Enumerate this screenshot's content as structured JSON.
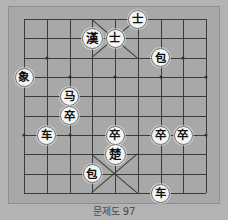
{
  "board": {
    "type": "janggi-xiangqi-diagram",
    "columns": 9,
    "rows": 10,
    "background_color": "#b3b3b3",
    "board_color": "#a8a8a8",
    "line_color": "#3b3b3b",
    "piece_face_color": "#f4f4f2",
    "piece_text_color": "#111111",
    "palace_top_columns": [
      3,
      5
    ],
    "palace_bottom_columns": [
      3,
      5
    ],
    "star_points": [
      {
        "col": 1,
        "row": 2
      },
      {
        "col": 7,
        "row": 2
      },
      {
        "col": 0,
        "row": 3
      },
      {
        "col": 2,
        "row": 3
      },
      {
        "col": 4,
        "row": 3
      },
      {
        "col": 6,
        "row": 3
      },
      {
        "col": 8,
        "row": 3
      },
      {
        "col": 1,
        "row": 6
      },
      {
        "col": 7,
        "row": 6
      },
      {
        "col": 0,
        "row": 6
      },
      {
        "col": 2,
        "row": 6
      },
      {
        "col": 4,
        "row": 6
      },
      {
        "col": 6,
        "row": 6
      },
      {
        "col": 8,
        "row": 6
      }
    ]
  },
  "pieces": [
    {
      "name": "advisor-top-right",
      "glyph": "士",
      "col": 5,
      "row": 0,
      "side": "top",
      "label": "advisor"
    },
    {
      "name": "general-han",
      "glyph": "漢",
      "col": 3,
      "row": 1,
      "side": "top",
      "label": "general-han",
      "big": true
    },
    {
      "name": "advisor-center",
      "glyph": "士",
      "col": 4,
      "row": 1,
      "side": "top",
      "label": "advisor"
    },
    {
      "name": "cannon-top-right",
      "glyph": "包",
      "col": 6,
      "row": 2,
      "side": "top",
      "label": "cannon"
    },
    {
      "name": "elephant-left",
      "glyph": "象",
      "col": 0,
      "row": 3,
      "side": "top",
      "label": "elephant"
    },
    {
      "name": "horse-left",
      "glyph": "马",
      "col": 2,
      "row": 4,
      "side": "bottom",
      "label": "horse"
    },
    {
      "name": "pawn-left-upper",
      "glyph": "卒",
      "col": 2,
      "row": 5,
      "side": "bottom",
      "label": "pawn"
    },
    {
      "name": "chariot-left",
      "glyph": "车",
      "col": 1,
      "row": 6,
      "side": "bottom",
      "label": "chariot"
    },
    {
      "name": "pawn-center",
      "glyph": "卒",
      "col": 4,
      "row": 6,
      "side": "bottom",
      "label": "pawn"
    },
    {
      "name": "pawn-right-inner",
      "glyph": "卒",
      "col": 6,
      "row": 6,
      "side": "bottom",
      "label": "pawn"
    },
    {
      "name": "pawn-right-outer",
      "glyph": "卒",
      "col": 7,
      "row": 6,
      "side": "bottom",
      "label": "pawn"
    },
    {
      "name": "general-chu",
      "glyph": "楚",
      "col": 4,
      "row": 7,
      "side": "bottom",
      "label": "general-chu",
      "big": true
    },
    {
      "name": "cannon-bottom-left",
      "glyph": "包",
      "col": 3,
      "row": 8,
      "side": "bottom",
      "label": "cannon"
    },
    {
      "name": "chariot-bottom-right",
      "glyph": "车",
      "col": 6,
      "row": 9,
      "side": "bottom",
      "label": "chariot"
    }
  ],
  "caption": {
    "text": "문제도 97"
  }
}
